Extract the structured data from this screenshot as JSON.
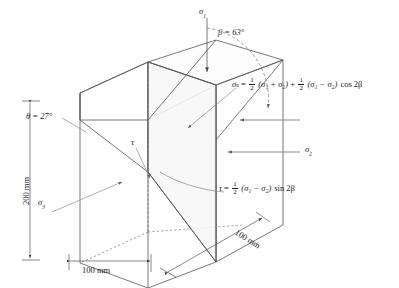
{
  "figure": {
    "type": "engineering-stress-block-diagram",
    "background_color": "#ffffff",
    "line_color": "#4d4d4d",
    "text_color": "#1a1a1a"
  },
  "angles": {
    "beta": "β = 63°",
    "beta_symbol": "β",
    "beta_value": "63",
    "theta": "θ = 27°",
    "theta_symbol": "θ",
    "theta_value": "27",
    "degree_unit": "°"
  },
  "stress_labels": {
    "sigma1": "σ",
    "sigma1_sub": "1",
    "sigma2": "σ",
    "sigma2_sub": "2",
    "sigma3": "σ",
    "sigma3_sub": "3",
    "tau": "τ"
  },
  "dimensions": {
    "height": "200 mm",
    "width": "100 mm",
    "depth": "100 mm"
  },
  "equations": {
    "normal_stress": {
      "lhs_symbol": "σ",
      "lhs_sub": "n",
      "equals": "=",
      "frac1_num": "1",
      "frac1_den": "2",
      "term1": "(σ₁ + σ₂)",
      "plus": "+",
      "frac2_num": "1",
      "frac2_den": "2",
      "term2": "(σ₁ − σ₂)",
      "trig": "cos 2β",
      "full": "σₙ = ½(σ₁ + σ₂) + ½(σ₁ − σ₂) cos 2β"
    },
    "shear_stress": {
      "lhs_symbol": "τ",
      "equals": "=",
      "frac_num": "1",
      "frac_den": "2",
      "term": "(σ₁ − σ₂)",
      "trig": "sin 2β",
      "full": "τ = ½(σ₁ − σ₂) sin 2β"
    },
    "open_paren": "(",
    "close_paren": ")",
    "minus": "−",
    "plus": "+"
  }
}
